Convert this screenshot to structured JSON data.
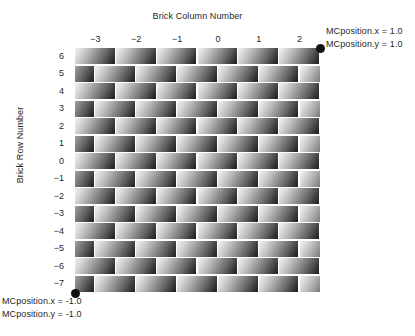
{
  "figure": {
    "x_axis_title": "Brick Column Number",
    "y_axis_title": "Brick Row Number"
  },
  "annotations": {
    "top_right_x": "MCposition.x = 1.0",
    "top_right_y": "MCposition.y = 1.0",
    "bottom_left_x": "MCposition.x = -1.0",
    "bottom_left_y": "MCposition.y = -1.0"
  },
  "chart_data": {
    "type": "heatmap",
    "title": "",
    "xlabel": "Brick Column Number",
    "ylabel": "Brick Row Number",
    "x_tick_labels": [
      "−3",
      "−2",
      "−1",
      "0",
      "1",
      "2"
    ],
    "x_tick_values": [
      -3,
      -2,
      -1,
      0,
      1,
      2
    ],
    "y_tick_labels": [
      "6",
      "5",
      "4",
      "3",
      "2",
      "1",
      "0",
      "−1",
      "−2",
      "−3",
      "−4",
      "−5",
      "−6",
      "−7"
    ],
    "y_tick_values": [
      6,
      5,
      4,
      3,
      2,
      1,
      0,
      -1,
      -2,
      -3,
      -4,
      -5,
      -6,
      -7
    ],
    "xlim": [
      -3.5,
      2.5
    ],
    "ylim": [
      -7.5,
      6.5
    ],
    "grid": false,
    "legend": "none",
    "pattern": "running-bond brick wall; alternate rows offset by half a brick width",
    "brick_columns": 6,
    "brick_rows": 14,
    "cell_shading": "linear gradient from light grey at upper-left corner to near-black at lower-right corner of each brick",
    "colors": {
      "gradient_light": "#f2f2f2",
      "gradient_dark": "#1c1c1c",
      "mortar": "#ffffff",
      "marker": "#111111",
      "text": "#1f1f1f"
    },
    "markers": [
      {
        "name": "bottom-left-corner",
        "mc_x": -1.0,
        "mc_y": -1.0
      },
      {
        "name": "top-right-corner",
        "mc_x": 1.0,
        "mc_y": 1.0
      }
    ]
  }
}
